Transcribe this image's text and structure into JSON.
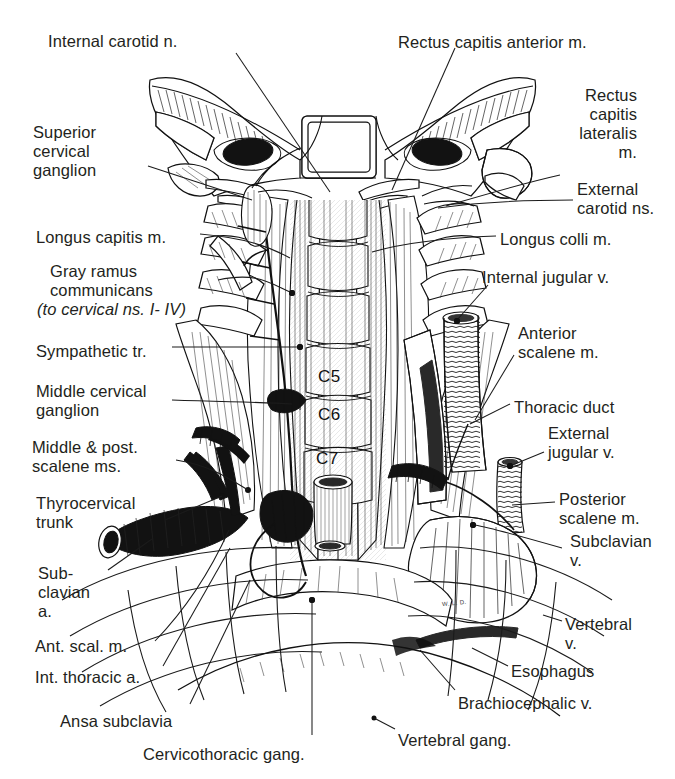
{
  "figure": {
    "artist_signature": "W. L. D.",
    "style": "pen-and-ink anatomical engraving",
    "background_color": "#ffffff",
    "ink_color": "#231f20"
  },
  "vertebral_tags": [
    {
      "label": "C5",
      "x": 318,
      "y": 368
    },
    {
      "label": "C6",
      "x": 318,
      "y": 406
    },
    {
      "label": "C7",
      "x": 316,
      "y": 450
    }
  ],
  "labels_left": [
    {
      "id": "internal-carotid-n",
      "text": "Internal carotid n.",
      "x": 48,
      "y": 32,
      "align": "left",
      "italic": false
    },
    {
      "id": "superior-cervical-gang",
      "text": "Superior\ncervical\nganglion",
      "x": 33,
      "y": 123,
      "align": "left",
      "italic": false
    },
    {
      "id": "longus-capitis-m",
      "text": "Longus capitis m.",
      "x": 36,
      "y": 228,
      "align": "left",
      "italic": false
    },
    {
      "id": "gray-ramus-communicans",
      "text": "Gray ramus\ncommunicans",
      "x": 50,
      "y": 262,
      "align": "left",
      "italic": false
    },
    {
      "id": "to-cervical-ns",
      "text": "(to cervical ns. I- IV)",
      "x": 37,
      "y": 300,
      "align": "left",
      "italic": true
    },
    {
      "id": "sympathetic-tr",
      "text": "Sympathetic tr.",
      "x": 36,
      "y": 342,
      "align": "left",
      "italic": false
    },
    {
      "id": "middle-cervical-gang",
      "text": "Middle cervical\nganglion",
      "x": 36,
      "y": 382,
      "align": "left",
      "italic": false
    },
    {
      "id": "middle-post-scalene-ms",
      "text": "Middle & post.\nscalene ms.",
      "x": 32,
      "y": 438,
      "align": "left",
      "italic": false
    },
    {
      "id": "thyrocervical-trunk",
      "text": "Thyrocervical\ntrunk",
      "x": 36,
      "y": 494,
      "align": "left",
      "italic": false
    },
    {
      "id": "subclavian-a",
      "text": "Sub-\nclavian\na.",
      "x": 38,
      "y": 564,
      "align": "left",
      "italic": false
    },
    {
      "id": "ant-scal-m",
      "text": "Ant. scal. m.",
      "x": 35,
      "y": 637,
      "align": "left",
      "italic": false
    },
    {
      "id": "int-thoracic-a",
      "text": "Int. thoracic a.",
      "x": 35,
      "y": 668,
      "align": "left",
      "italic": false
    },
    {
      "id": "ansa-subclavia",
      "text": "Ansa subclavia",
      "x": 60,
      "y": 712,
      "align": "left",
      "italic": false
    },
    {
      "id": "cervicothoracic-gang",
      "text": "Cervicothoracic gang.",
      "x": 143,
      "y": 745,
      "align": "left",
      "italic": false
    }
  ],
  "labels_right": [
    {
      "id": "rectus-capitis-anterior-m",
      "text": "Rectus capitis anterior m.",
      "x": 398,
      "y": 33,
      "align": "left",
      "italic": false
    },
    {
      "id": "rectus-capitis-lateralis-m",
      "text": "Rectus\ncapitis\nlateralis\nm.",
      "x": 637,
      "y": 86,
      "align": "right",
      "italic": false
    },
    {
      "id": "external-carotid-ns",
      "text": "External\ncarotid ns.",
      "x": 577,
      "y": 180,
      "align": "left",
      "italic": false
    },
    {
      "id": "longus-colli-m",
      "text": "Longus colli m.",
      "x": 500,
      "y": 230,
      "align": "left",
      "italic": false
    },
    {
      "id": "internal-jugular-v",
      "text": "Internal jugular v.",
      "x": 482,
      "y": 268,
      "align": "left",
      "italic": false
    },
    {
      "id": "anterior-scalene-m",
      "text": "Anterior\nscalene m.",
      "x": 518,
      "y": 324,
      "align": "left",
      "italic": false
    },
    {
      "id": "thoracic-duct",
      "text": "Thoracic duct",
      "x": 514,
      "y": 398,
      "align": "left",
      "italic": false
    },
    {
      "id": "external-jugular-v",
      "text": "External\njugular v.",
      "x": 548,
      "y": 424,
      "align": "left",
      "italic": false
    },
    {
      "id": "posterior-scalene-m",
      "text": "Posterior\nscalene m.",
      "x": 559,
      "y": 490,
      "align": "left",
      "italic": false
    },
    {
      "id": "subclavian-v",
      "text": "Subclavian\nv.",
      "x": 570,
      "y": 532,
      "align": "left",
      "italic": false
    },
    {
      "id": "vertebral-v",
      "text": "Vertebral\nv.",
      "x": 565,
      "y": 615,
      "align": "left",
      "italic": false
    },
    {
      "id": "esophagus",
      "text": "Esophagus",
      "x": 511,
      "y": 662,
      "align": "left",
      "italic": false
    },
    {
      "id": "brachiocephalic-v",
      "text": "Brachiocephalic v.",
      "x": 458,
      "y": 694,
      "align": "left",
      "italic": false
    },
    {
      "id": "vertebral-gang",
      "text": "Vertebral gang.",
      "x": 398,
      "y": 731,
      "align": "left",
      "italic": false
    }
  ],
  "leader_lines": [
    {
      "id": "leader-internal-carotid-n",
      "path": "M 236 53 L 330 192"
    },
    {
      "id": "leader-superior-cervical-gang",
      "path": "M 148 166 L 252 200"
    },
    {
      "id": "leader-longus-capitis-m",
      "path": "M 200 234 C 245 238 268 246 290 258"
    },
    {
      "id": "leader-gray-ramus-communicans",
      "path": "M 218 280 C 255 272 268 282 290 292"
    },
    {
      "id": "leader-sympathetic-tr",
      "path": "M 172 347 L 300 347"
    },
    {
      "id": "leader-middle-cervical-gang",
      "path": "M 172 400 C 230 402 262 402 292 404"
    },
    {
      "id": "leader-middle-post-scalene-ms",
      "path": "M 176 460 C 212 466 228 478 248 490"
    },
    {
      "id": "leader-thyrocervical-trunk",
      "path": "M 165 520 L 222 496"
    },
    {
      "id": "leader-subclavian-a",
      "path": "M 108 570 L 152 539"
    },
    {
      "id": "leader-ant-scal-m",
      "path": "M 155 641 C 185 610 210 572 229 530"
    },
    {
      "id": "leader-int-thoracic-a",
      "path": "M 163 666 L 230 548"
    },
    {
      "id": "leader-ansa-subclavia",
      "path": "M 190 704 L 250 580"
    },
    {
      "id": "leader-cervicothoracic-gang",
      "path": "M 312 735 L 312 600"
    },
    {
      "id": "leader-rectus-capitis-anterior",
      "path": "M 455 48 L 392 190"
    },
    {
      "id": "leader-rectus-capitis-lateralis",
      "path": "M 560 175 C 520 184 480 196 446 206"
    },
    {
      "id": "leader-external-carotid-ns",
      "path": "M 573 200 C 520 200 480 202 438 208"
    },
    {
      "id": "leader-longus-colli-m",
      "path": "M 496 236 C 440 238 400 244 372 252"
    },
    {
      "id": "leader-internal-jugular-v",
      "path": "M 488 285 L 457 320"
    },
    {
      "id": "leader-anterior-scalene-m",
      "path": "M 514 355 L 475 420"
    },
    {
      "id": "leader-thoracic-duct",
      "path": "M 510 404 L 470 424"
    },
    {
      "id": "leader-external-jugular-v",
      "path": "M 544 452 L 510 466"
    },
    {
      "id": "leader-posterior-scalene-m",
      "path": "M 555 502 L 512 505"
    },
    {
      "id": "leader-subclavian-v",
      "path": "M 562 548 C 520 536 492 528 475 525"
    },
    {
      "id": "leader-vertebral-v",
      "path": "M 562 621 L 543 615"
    },
    {
      "id": "leader-esophagus",
      "path": "M 508 666 L 472 648"
    },
    {
      "id": "leader-brachiocephalic-v",
      "path": "M 455 690 L 420 650"
    },
    {
      "id": "leader-vertebral-gang",
      "path": "M 395 729 L 374 718"
    }
  ],
  "leader_dots": [
    {
      "id": "dot-internal-jugular-v",
      "x": 457,
      "y": 321
    },
    {
      "id": "dot-external-jugular-v",
      "x": 510,
      "y": 466
    },
    {
      "id": "dot-subclavian-v",
      "x": 473,
      "y": 525
    },
    {
      "id": "dot-sympathetic-tr",
      "x": 300,
      "y": 347
    },
    {
      "id": "dot-gray-ramus",
      "x": 292,
      "y": 293
    },
    {
      "id": "dot-cervicothoracic",
      "x": 312,
      "y": 600
    }
  ]
}
